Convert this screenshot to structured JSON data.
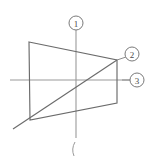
{
  "figure": {
    "type": "line-drawing",
    "background_color": "#ffffff",
    "line_color": "#6b6b6b",
    "axis_color": "#9a9a9a",
    "marker_stroke_color": "#7a7a7a",
    "marker_text_color": "#4a4a4a",
    "canvas": {
      "width": 156,
      "height": 157
    },
    "axes": {
      "vertical": {
        "x": 76,
        "y1": 30,
        "y2": 138
      },
      "horizontal": {
        "y": 80,
        "x1": 10,
        "x2": 130
      }
    },
    "quadrilateral": {
      "label": "trapezoid-outline",
      "points": "29,42 117,60 117,103 30,120"
    },
    "diagonal": {
      "label": "diagonal-line",
      "x1": 13,
      "y1": 129,
      "x2": 117,
      "y2": 60
    },
    "tick_mark": {
      "label": "bottom-paren-mark",
      "path": "M 75,142 Q 71,149 74,156"
    },
    "markers": [
      {
        "name": "marker-1",
        "text": "1",
        "cx": 76,
        "cy": 23,
        "r": 7
      },
      {
        "name": "marker-2",
        "text": "2",
        "cx": 132,
        "cy": 54,
        "r": 7
      },
      {
        "name": "marker-3",
        "text": "3",
        "cx": 137,
        "cy": 80,
        "r": 7
      }
    ],
    "leader_lines": [
      {
        "name": "leader-to-marker-2",
        "x1": 117,
        "y1": 60,
        "x2": 126,
        "y2": 57
      },
      {
        "name": "leader-to-marker-3",
        "x1": 122,
        "y1": 80,
        "x2": 130,
        "y2": 80
      }
    ]
  }
}
